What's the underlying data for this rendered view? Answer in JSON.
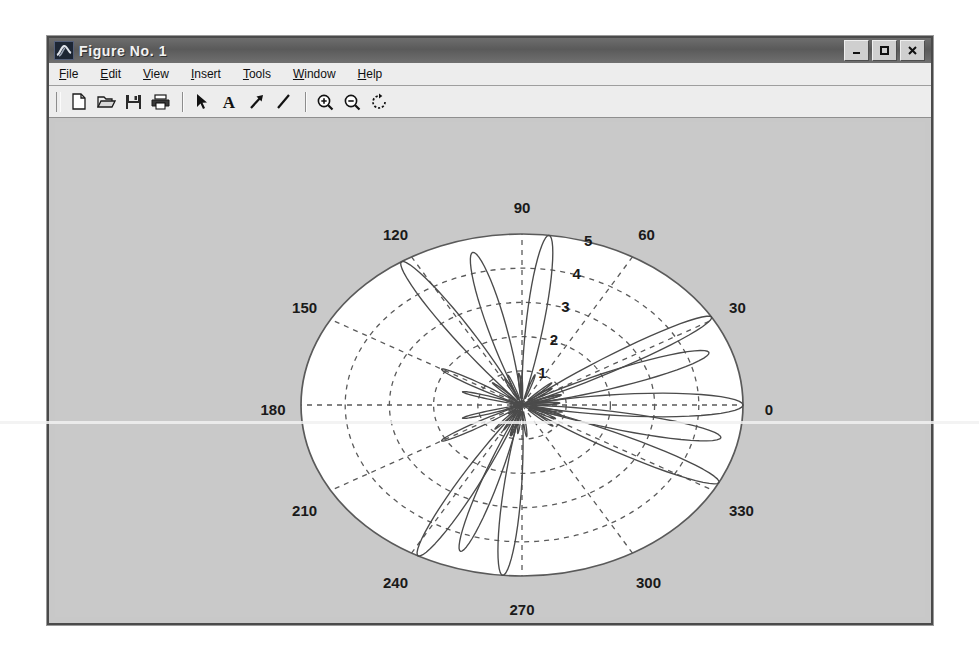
{
  "window": {
    "title": "Figure No. 1",
    "icon": "matlab-membrane-icon",
    "controls": {
      "minimize": "_",
      "maximize": "□",
      "close": "✕"
    }
  },
  "menubar": {
    "items": [
      {
        "label": "File",
        "mnemonic": "F",
        "name": "menu-file"
      },
      {
        "label": "Edit",
        "mnemonic": "E",
        "name": "menu-edit"
      },
      {
        "label": "View",
        "mnemonic": "V",
        "name": "menu-view"
      },
      {
        "label": "Insert",
        "mnemonic": "I",
        "name": "menu-insert"
      },
      {
        "label": "Tools",
        "mnemonic": "T",
        "name": "menu-tools"
      },
      {
        "label": "Window",
        "mnemonic": "W",
        "name": "menu-window"
      },
      {
        "label": "Help",
        "mnemonic": "H",
        "name": "menu-help"
      }
    ]
  },
  "toolbar": {
    "buttons": [
      {
        "name": "new-figure-icon",
        "tooltip": "New Figure"
      },
      {
        "name": "open-file-icon",
        "tooltip": "Open File"
      },
      {
        "name": "save-figure-icon",
        "tooltip": "Save Figure"
      },
      {
        "name": "print-figure-icon",
        "tooltip": "Print Figure"
      },
      {
        "name": "edit-plot-arrow-icon",
        "tooltip": "Edit Plot"
      },
      {
        "name": "insert-text-icon",
        "tooltip": "Insert Text"
      },
      {
        "name": "insert-arrow-icon",
        "tooltip": "Insert Arrow"
      },
      {
        "name": "insert-line-icon",
        "tooltip": "Insert Line"
      },
      {
        "name": "zoom-in-icon",
        "tooltip": "Zoom In"
      },
      {
        "name": "zoom-out-icon",
        "tooltip": "Zoom Out"
      },
      {
        "name": "rotate-3d-icon",
        "tooltip": "Rotate 3D"
      }
    ]
  },
  "colors": {
    "figure_background": "#c9c9c9",
    "axes_background": "#ffffff",
    "grid": "#5a5a5a",
    "line": "#4b4b4b",
    "title_bar": "#5e5e5e",
    "toolbar": "#ededed"
  },
  "chart_data": {
    "type": "line",
    "plot_kind": "polar",
    "title": "",
    "xlabel": "",
    "ylabel": "",
    "angle_unit": "degrees",
    "theta_direction": "counterclockwise",
    "theta_zero_location": "E",
    "rlim": [
      0,
      5
    ],
    "grid": true,
    "legend": null,
    "angular_tick_labels": [
      "0",
      "30",
      "60",
      "90",
      "120",
      "150",
      "180",
      "210",
      "240",
      "270",
      "300",
      "330"
    ],
    "angular_ticks_deg": [
      0,
      30,
      60,
      90,
      120,
      150,
      180,
      210,
      240,
      270,
      300,
      330
    ],
    "radial_tick_labels": [
      "1",
      "2",
      "3",
      "4",
      "5"
    ],
    "radial_ticks": [
      1,
      2,
      3,
      4,
      5
    ],
    "radial_label_angle_deg": 75,
    "series": [
      {
        "name": "lobe-1",
        "peak_angle_deg": 0,
        "peak_r": 5.0,
        "half_width_deg": 13
      },
      {
        "name": "lobe-2",
        "peak_angle_deg": 20,
        "peak_r": 4.5,
        "half_width_deg": 11
      },
      {
        "name": "lobe-3",
        "peak_angle_deg": 31,
        "peak_r": 5.0,
        "half_width_deg": 9
      },
      {
        "name": "lobe-4",
        "peak_angle_deg": 348,
        "peak_r": 4.6,
        "half_width_deg": 11
      },
      {
        "name": "lobe-5",
        "peak_angle_deg": 333,
        "peak_r": 5.0,
        "half_width_deg": 10
      },
      {
        "name": "lobe-6",
        "peak_angle_deg": 83,
        "peak_r": 5.0,
        "half_width_deg": 8
      },
      {
        "name": "lobe-7",
        "peak_angle_deg": 104,
        "peak_r": 4.6,
        "half_width_deg": 9
      },
      {
        "name": "lobe-8",
        "peak_angle_deg": 123,
        "peak_r": 5.0,
        "half_width_deg": 9
      },
      {
        "name": "lobe-9",
        "peak_angle_deg": 265,
        "peak_r": 5.0,
        "half_width_deg": 8
      },
      {
        "name": "lobe-10",
        "peak_angle_deg": 252,
        "peak_r": 4.5,
        "half_width_deg": 8
      },
      {
        "name": "lobe-11",
        "peak_angle_deg": 242,
        "peak_r": 5.0,
        "half_width_deg": 9
      },
      {
        "name": "lobe-12",
        "peak_angle_deg": 150,
        "peak_r": 2.1,
        "half_width_deg": 7
      },
      {
        "name": "lobe-13",
        "peak_angle_deg": 210,
        "peak_r": 2.1,
        "half_width_deg": 7
      },
      {
        "name": "lobe-14",
        "peak_angle_deg": 196,
        "peak_r": 1.4,
        "half_width_deg": 6
      },
      {
        "name": "lobe-15",
        "peak_angle_deg": 164,
        "peak_r": 1.4,
        "half_width_deg": 6
      }
    ]
  }
}
